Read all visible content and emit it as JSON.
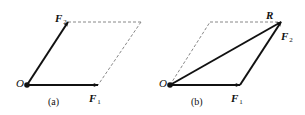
{
  "diagram": {
    "type": "parallelogram-law-of-forces",
    "panel_a": {
      "caption": "(a)",
      "origin_label": "O",
      "vectors": [
        {
          "name": "F1",
          "label": "F",
          "subscript": "1",
          "from": [
            27,
            85
          ],
          "to": [
            98,
            85
          ]
        },
        {
          "name": "F2",
          "label": "F",
          "subscript": "2",
          "from": [
            27,
            85
          ],
          "to": [
            68,
            22
          ]
        }
      ],
      "dashed_lines": [
        {
          "from": [
            68,
            22
          ],
          "to": [
            141,
            22
          ]
        },
        {
          "from": [
            141,
            22
          ],
          "to": [
            98,
            85
          ]
        }
      ]
    },
    "panel_b": {
      "caption": "(b)",
      "origin_label": "O",
      "vectors": [
        {
          "name": "F1",
          "label": "F",
          "subscript": "1",
          "from": [
            170,
            85
          ],
          "to": [
            240,
            85
          ]
        },
        {
          "name": "F2",
          "label": "F",
          "subscript": "2",
          "from": [
            240,
            85
          ],
          "to": [
            281,
            22
          ]
        },
        {
          "name": "R",
          "label": "R",
          "subscript": "",
          "from": [
            170,
            85
          ],
          "to": [
            281,
            22
          ]
        }
      ],
      "dashed_lines": [
        {
          "from": [
            170,
            85
          ],
          "to": [
            210,
            22
          ]
        },
        {
          "from": [
            210,
            22
          ],
          "to": [
            281,
            22
          ]
        }
      ]
    },
    "colors": {
      "stroke": "#111111",
      "dashed": "#888888",
      "background": "#ffffff"
    }
  }
}
